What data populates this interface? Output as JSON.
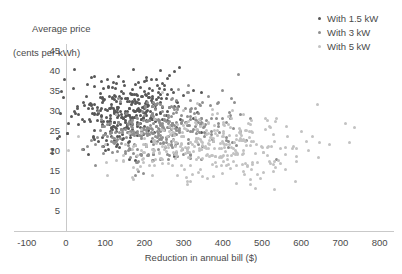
{
  "chart_data": {
    "type": "scatter",
    "title": "",
    "xlabel": "Reduction in annual bill ($)",
    "ylabel": "Average price (cents per kWh)",
    "ylabel_line1": "Average price",
    "ylabel_line2": "(cents per kWh)",
    "xlim": [
      -100,
      800
    ],
    "ylim": [
      0,
      47
    ],
    "xticks": [
      -100,
      0,
      100,
      200,
      300,
      400,
      500,
      600,
      700,
      800
    ],
    "yticks": [
      5,
      10,
      15,
      20,
      25,
      30,
      35,
      40,
      45
    ],
    "grid": false,
    "legend_position": "top-right",
    "series": [
      {
        "name": "With 1.5 kW",
        "color": "#575757",
        "n_points": 340,
        "x_mean": 115,
        "x_sd": 78,
        "y_mean": 29.5,
        "y_sd": 4.2,
        "x_min": -60,
        "x_max": 420,
        "y_min": 17,
        "y_max": 45
      },
      {
        "name": "With 3 kW",
        "color": "#8f8f8f",
        "n_points": 340,
        "x_mean": 205,
        "x_sd": 110,
        "y_mean": 25.0,
        "y_sd": 4.0,
        "x_min": -40,
        "x_max": 600,
        "y_min": 13,
        "y_max": 41
      },
      {
        "name": "With 5 kW",
        "color": "#c2c2c2",
        "n_points": 340,
        "x_mean": 300,
        "x_sd": 150,
        "y_mean": 21.5,
        "y_sd": 4.0,
        "x_min": -20,
        "x_max": 760,
        "y_min": 9,
        "y_max": 38
      }
    ]
  },
  "legend": {
    "items": [
      {
        "label": "With 1.5 kW",
        "color": "#575757"
      },
      {
        "label": "With 3 kW",
        "color": "#8f8f8f"
      },
      {
        "label": "With 5 kW",
        "color": "#c2c2c2"
      }
    ]
  },
  "axes": {
    "x_title": "Reduction in annual bill ($)",
    "y_title_line1": "Average price",
    "y_title_line2": "(cents per kWh)",
    "x_tick_labels": [
      "-100",
      "0",
      "100",
      "200",
      "300",
      "400",
      "500",
      "600",
      "700",
      "800"
    ],
    "y_tick_labels": [
      "45",
      "40",
      "35",
      "30",
      "25",
      "20",
      "15",
      "10",
      "5"
    ]
  },
  "colors": {
    "axis_line": "#c9c9c9",
    "text": "#4a4a4a",
    "background": "#ffffff"
  }
}
